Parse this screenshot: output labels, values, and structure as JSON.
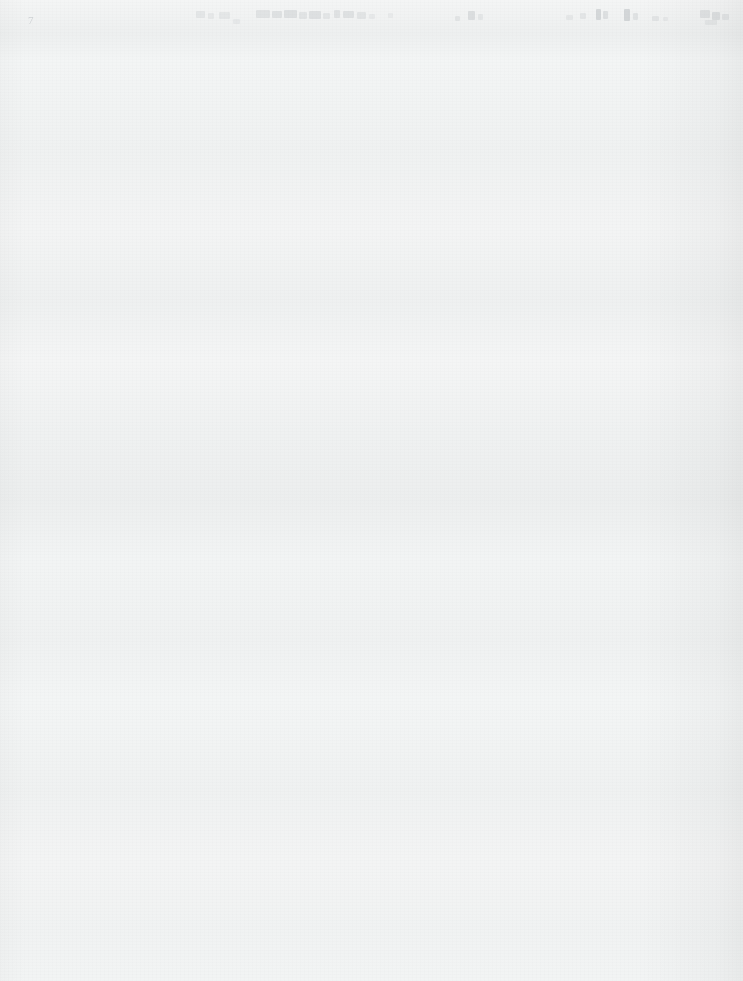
{
  "page": {
    "kind": "scanned-document-page",
    "width": 743,
    "height": 981,
    "paper_color": "#f8f9f9",
    "edge_shadow_color": "#000000",
    "body_text": "",
    "body_note": "page body is blank"
  },
  "header": {
    "legible": false,
    "note": "single row of severely faded, illegible text across the top edge",
    "ink_color": "#9fa5aa",
    "corner_mark": "7",
    "fragments": [
      {
        "x": 196,
        "y": 11,
        "width": 9,
        "height": 7,
        "opacity": 0.16
      },
      {
        "x": 208,
        "y": 13,
        "width": 6,
        "height": 6,
        "opacity": 0.13
      },
      {
        "x": 219,
        "y": 12,
        "width": 11,
        "height": 7,
        "opacity": 0.15
      },
      {
        "x": 233,
        "y": 19,
        "width": 7,
        "height": 5,
        "opacity": 0.12
      },
      {
        "x": 256,
        "y": 10,
        "width": 14,
        "height": 8,
        "opacity": 0.2
      },
      {
        "x": 272,
        "y": 11,
        "width": 10,
        "height": 7,
        "opacity": 0.22
      },
      {
        "x": 284,
        "y": 10,
        "width": 13,
        "height": 8,
        "opacity": 0.24
      },
      {
        "x": 299,
        "y": 12,
        "width": 8,
        "height": 7,
        "opacity": 0.19
      },
      {
        "x": 309,
        "y": 11,
        "width": 12,
        "height": 8,
        "opacity": 0.23
      },
      {
        "x": 323,
        "y": 13,
        "width": 7,
        "height": 6,
        "opacity": 0.16
      },
      {
        "x": 334,
        "y": 10,
        "width": 6,
        "height": 8,
        "opacity": 0.21
      },
      {
        "x": 343,
        "y": 11,
        "width": 11,
        "height": 7,
        "opacity": 0.22
      },
      {
        "x": 357,
        "y": 12,
        "width": 9,
        "height": 7,
        "opacity": 0.18
      },
      {
        "x": 369,
        "y": 14,
        "width": 6,
        "height": 5,
        "opacity": 0.12
      },
      {
        "x": 388,
        "y": 13,
        "width": 5,
        "height": 5,
        "opacity": 0.1
      },
      {
        "x": 455,
        "y": 16,
        "width": 5,
        "height": 5,
        "opacity": 0.17
      },
      {
        "x": 468,
        "y": 11,
        "width": 7,
        "height": 9,
        "opacity": 0.26
      },
      {
        "x": 478,
        "y": 14,
        "width": 5,
        "height": 6,
        "opacity": 0.15
      },
      {
        "x": 566,
        "y": 15,
        "width": 7,
        "height": 5,
        "opacity": 0.14
      },
      {
        "x": 580,
        "y": 13,
        "width": 6,
        "height": 6,
        "opacity": 0.16
      },
      {
        "x": 596,
        "y": 9,
        "width": 5,
        "height": 11,
        "opacity": 0.34
      },
      {
        "x": 603,
        "y": 11,
        "width": 5,
        "height": 8,
        "opacity": 0.24
      },
      {
        "x": 624,
        "y": 9,
        "width": 6,
        "height": 12,
        "opacity": 0.36
      },
      {
        "x": 633,
        "y": 13,
        "width": 5,
        "height": 7,
        "opacity": 0.2
      },
      {
        "x": 652,
        "y": 16,
        "width": 7,
        "height": 5,
        "opacity": 0.17
      },
      {
        "x": 663,
        "y": 17,
        "width": 5,
        "height": 4,
        "opacity": 0.12
      },
      {
        "x": 700,
        "y": 10,
        "width": 10,
        "height": 8,
        "opacity": 0.22
      },
      {
        "x": 712,
        "y": 12,
        "width": 8,
        "height": 8,
        "opacity": 0.26
      },
      {
        "x": 722,
        "y": 14,
        "width": 7,
        "height": 6,
        "opacity": 0.18
      },
      {
        "x": 705,
        "y": 20,
        "width": 12,
        "height": 5,
        "opacity": 0.14
      }
    ]
  }
}
